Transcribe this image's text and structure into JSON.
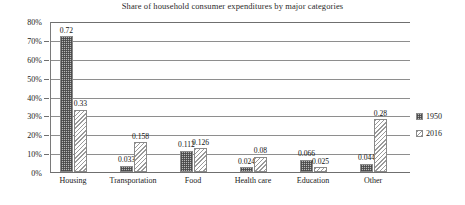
{
  "chart_data": {
    "type": "bar",
    "title": "Share of household consumer expenditures by major categories",
    "xlabel": "",
    "ylabel": "",
    "ylim": [
      0,
      0.8
    ],
    "grid": true,
    "legend_position": "right",
    "categories": [
      "Housing",
      "Transportation",
      "Food",
      "Health care",
      "Education",
      "Other"
    ],
    "ytick_labels": [
      "0%",
      "10%",
      "20%",
      "30%",
      "40%",
      "50%",
      "60%",
      "70%",
      "80%"
    ],
    "ytick_values": [
      0,
      0.1,
      0.2,
      0.3,
      0.4,
      0.5,
      0.6,
      0.7,
      0.8
    ],
    "series": [
      {
        "name": "1950",
        "pattern": "dotted-gray",
        "values": [
          0.72,
          0.033,
          0.112,
          0.024,
          0.066,
          0.044
        ],
        "labels": [
          "0.72",
          "0.033",
          "0.112",
          "0.024",
          "0.066",
          "0.044"
        ]
      },
      {
        "name": "2016",
        "pattern": "diagonal-hatch",
        "values": [
          0.33,
          0.158,
          0.126,
          0.08,
          0.025,
          0.28
        ],
        "labels": [
          "0.33",
          "0.158",
          "0.126",
          "0.08",
          "0.025",
          "0.28"
        ]
      }
    ]
  },
  "colors": {
    "series_1950_fill": "#b9b9b9",
    "series_2016_fill": "#ffffff",
    "pattern_ink": "#8a8a8a",
    "gridline": "#8e8e8e",
    "axis": "#6f6f6f",
    "text": "#1a1a1a",
    "background": "#ffffff"
  }
}
